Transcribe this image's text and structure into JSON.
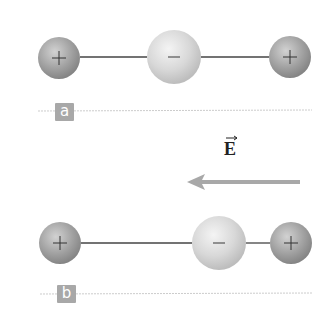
{
  "panels": [
    {
      "label": "a",
      "particles": [
        {
          "charge": "+",
          "cx": 59,
          "cy": 58,
          "r": 21
        },
        {
          "charge": "−",
          "cx": 174,
          "cy": 57,
          "r": 27
        },
        {
          "charge": "+",
          "cx": 290,
          "cy": 57,
          "r": 21
        }
      ]
    },
    {
      "label": "b",
      "particles": [
        {
          "charge": "+",
          "cx": 60,
          "cy": 243,
          "r": 21
        },
        {
          "charge": "−",
          "cx": 219,
          "cy": 243,
          "r": 27
        },
        {
          "charge": "+",
          "cx": 291,
          "cy": 243,
          "r": 21
        }
      ]
    }
  ],
  "field": {
    "symbol": "E",
    "direction": "left",
    "arrow_color": "#a8a8a8"
  },
  "colors": {
    "positive_sphere": "#9e9e9e",
    "negative_sphere": "#d6d6d6",
    "label_box": "#a8a8a8",
    "baseline": "#c8c8c8"
  }
}
